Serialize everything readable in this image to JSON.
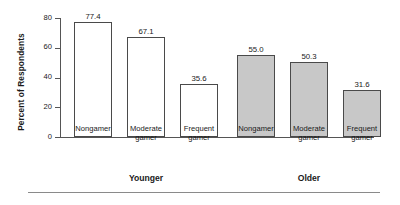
{
  "chart_data": {
    "type": "bar",
    "title": "",
    "xlabel": "",
    "ylabel": "Percent of Respondents",
    "ylim": [
      0,
      80
    ],
    "yticks": [
      0,
      20,
      40,
      60,
      80
    ],
    "ytick_labels": [
      "0",
      "20",
      "40",
      "60",
      "80"
    ],
    "grid": false,
    "legend": "none",
    "categories": [
      "Nongamer",
      "Moderate gamer",
      "Frequent gamer",
      "Nongamer",
      "Moderate gamer",
      "Frequent gamer"
    ],
    "values": [
      77.4,
      67.1,
      35.6,
      55.0,
      50.3,
      31.6
    ],
    "value_labels": [
      "77.4",
      "67.1",
      "35.6",
      "55.0",
      "50.3",
      "31.6"
    ],
    "bars": [
      {
        "label_line1": "Nongamer",
        "label_line2": "",
        "value": 77.4,
        "value_label": "77.4",
        "style": "open",
        "group": "Younger"
      },
      {
        "label_line1": "Moderate",
        "label_line2": "gamer",
        "value": 67.1,
        "value_label": "67.1",
        "style": "open",
        "group": "Younger"
      },
      {
        "label_line1": "Frequent",
        "label_line2": "gamer",
        "value": 35.6,
        "value_label": "35.6",
        "style": "open",
        "group": "Younger"
      },
      {
        "label_line1": "Nongamer",
        "label_line2": "",
        "value": 55.0,
        "value_label": "55.0",
        "style": "filled",
        "group": "Older"
      },
      {
        "label_line1": "Moderate",
        "label_line2": "gamer",
        "value": 50.3,
        "value_label": "50.3",
        "style": "filled",
        "group": "Older"
      },
      {
        "label_line1": "Frequent",
        "label_line2": "gamer",
        "value": 31.6,
        "value_label": "31.6",
        "style": "filled",
        "group": "Older"
      }
    ],
    "groups": [
      {
        "name": "Younger",
        "series_style": "open"
      },
      {
        "name": "Older",
        "series_style": "filled"
      }
    ],
    "colors": {
      "open_fill": "#ffffff",
      "filled_fill": "#c8c8c8",
      "bar_outline": "#4a4a4a",
      "axis": "#555555",
      "text": "#1a1a1a",
      "rule": "#8a8a8a"
    }
  }
}
